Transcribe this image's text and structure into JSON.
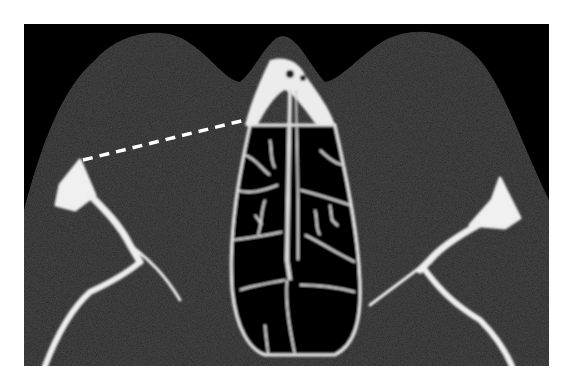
{
  "image": {
    "type": "CT axial slice",
    "description": "Axial CT of orbits and nasal cavity with dashed measurement line",
    "annotation": {
      "kind": "dashed-line",
      "color": "#ffffff",
      "from": [
        83,
        160
      ],
      "to": [
        245,
        120
      ]
    },
    "colors": {
      "background": "#000000",
      "soft_tissue": "#262626",
      "bone": "#f2f2f2",
      "air": "#000000",
      "border": "#ffffff"
    }
  }
}
